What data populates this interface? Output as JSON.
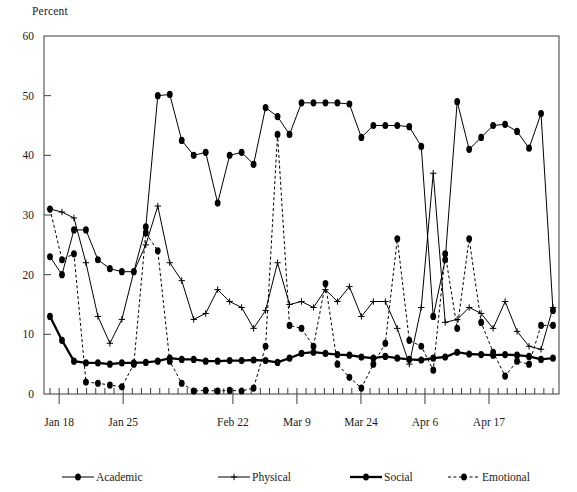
{
  "chart_data": {
    "type": "line",
    "title": "",
    "ylabel": "Percent",
    "xlabel": "",
    "ylim": [
      0,
      60
    ],
    "yticks": [
      0,
      10,
      20,
      30,
      40,
      50,
      60
    ],
    "grid": false,
    "legend_position": "bottom",
    "xtick_labels": [
      "Jan 18",
      "Jan 25",
      "Feb 22",
      "Mar 9",
      "Mar 24",
      "Apr 6",
      "Apr 17"
    ],
    "xtick_indices": [
      1,
      8,
      20,
      27,
      34,
      41,
      48
    ],
    "n_points": 56,
    "series": [
      {
        "name": "Academic",
        "marker": "filled-circle",
        "linestyle": "solid",
        "linewidth": 1,
        "values": [
          23,
          20,
          27.5,
          27.5,
          22.5,
          21,
          20.5,
          20.5,
          28,
          50,
          50.2,
          42.5,
          40,
          40.5,
          32,
          40,
          40.5,
          38.5,
          48,
          46.5,
          43.5,
          48.8,
          48.8,
          48.8,
          48.8,
          48.6,
          43,
          45,
          45,
          45,
          44.8,
          41.5,
          13,
          22.5,
          49,
          41,
          43,
          45,
          45.2,
          44,
          41.2,
          47,
          14
        ]
      },
      {
        "name": "Physical",
        "marker": "plus",
        "linestyle": "solid",
        "linewidth": 1,
        "values": [
          31,
          30.5,
          29.5,
          22,
          13,
          8.5,
          12.5,
          20.5,
          25,
          31.5,
          22,
          19,
          12.5,
          13.5,
          17.5,
          15.5,
          14.5,
          11,
          14,
          22,
          15,
          15.5,
          14.5,
          17.5,
          15.5,
          18,
          13,
          15.5,
          15.5,
          11,
          5,
          14.5,
          37,
          12,
          12.5,
          14.5,
          13.5,
          11,
          15.5,
          10.5,
          8,
          7.5,
          14.5
        ]
      },
      {
        "name": "Social",
        "marker": "filled-circle",
        "linestyle": "solid",
        "linewidth": 2.3,
        "values": [
          13,
          9,
          5.5,
          5.2,
          5.2,
          5,
          5.2,
          5.2,
          5.3,
          5.5,
          6,
          5.8,
          5.8,
          5.5,
          5.5,
          5.6,
          5.6,
          5.7,
          5.6,
          5.3,
          6,
          6.8,
          7,
          6.8,
          6.6,
          6.5,
          6.2,
          6,
          6.3,
          6,
          5.8,
          5.7,
          6,
          6.2,
          7,
          6.7,
          6.6,
          6.5,
          6.6,
          6.5,
          6.3,
          5.8,
          6
        ]
      },
      {
        "name": "Emotional",
        "marker": "filled-circle",
        "linestyle": "dashed",
        "linewidth": 1,
        "values": [
          31,
          22.5,
          23.5,
          2,
          1.8,
          1.5,
          1.2,
          5,
          27,
          24,
          5.5,
          1.8,
          0.5,
          0.6,
          0.5,
          0.6,
          0.5,
          1,
          8,
          43.5,
          11.5,
          11,
          8,
          18.5,
          5,
          2.8,
          1,
          5,
          8.5,
          26,
          9,
          8,
          4,
          23.5,
          11,
          26,
          12,
          7,
          3,
          5.5,
          5,
          11.5,
          11.5
        ]
      }
    ]
  },
  "legend": {
    "items": [
      {
        "label": "Academic"
      },
      {
        "label": "Physical"
      },
      {
        "label": "Social"
      },
      {
        "label": "Emotional"
      }
    ]
  }
}
